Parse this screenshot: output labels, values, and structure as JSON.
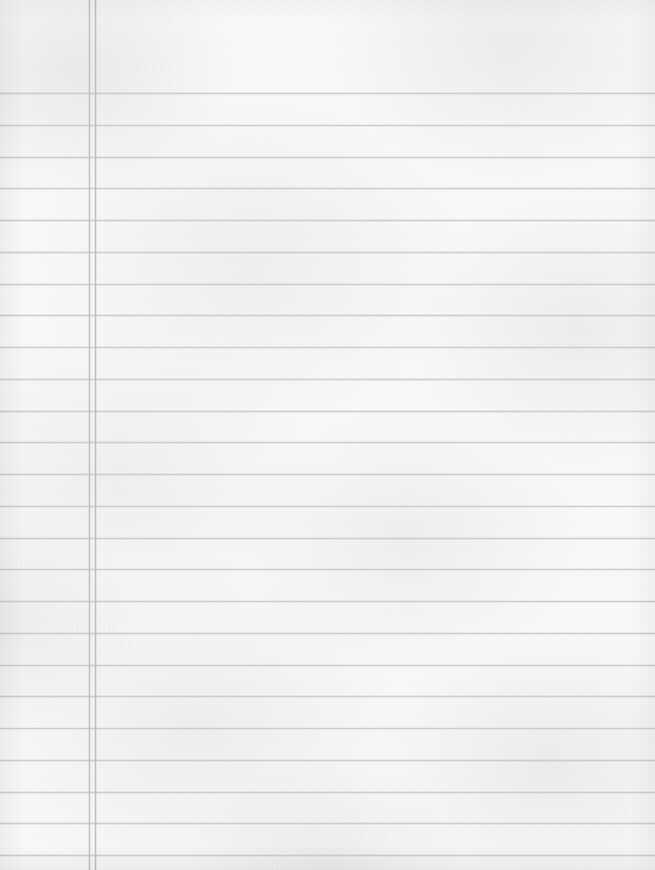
{
  "document": {
    "type": "scanned-lined-notebook-paper",
    "title": "Blank Lined Notebook Page",
    "caption": "Scanned blank ruled notebook paper with a double vertical margin rule on the left and twenty-five horizontal rule lines.",
    "width_px": 655,
    "height_px": 870,
    "text_content": "",
    "has_handwriting": false,
    "has_printed_text": false
  },
  "colors": {
    "paper": "#f9f9f8",
    "paper_shadow": "#e6e7ea",
    "rule_line": "#c9cdd3",
    "margin_line": "#b9bec6",
    "page_background": "#ffffff"
  },
  "ruling": {
    "style": "college-ruled",
    "orientation": "portrait",
    "rule_line_count": 25,
    "first_rule_y": 93,
    "rule_spacing_px": 31.75,
    "rule_thickness_px": 1,
    "rule_lines_y": [
      93,
      124.8,
      156.5,
      188.3,
      220,
      251.8,
      283.5,
      315.3,
      347,
      378.8,
      410.5,
      442.3,
      474,
      505.8,
      537.5,
      569.3,
      601,
      632.8,
      664.5,
      696.3,
      728,
      759.8,
      791.5,
      823.3,
      855
    ],
    "margin_line_count": 2,
    "margin_lines_x": [
      89,
      95
    ],
    "margin_thickness_px": 1,
    "margin_side": "left",
    "left_margin_width_px": 95
  },
  "regions": {
    "margin_area_label": "left margin gutter",
    "writing_area_label": "ruled writing area",
    "header_area_label": "unruled header area"
  }
}
